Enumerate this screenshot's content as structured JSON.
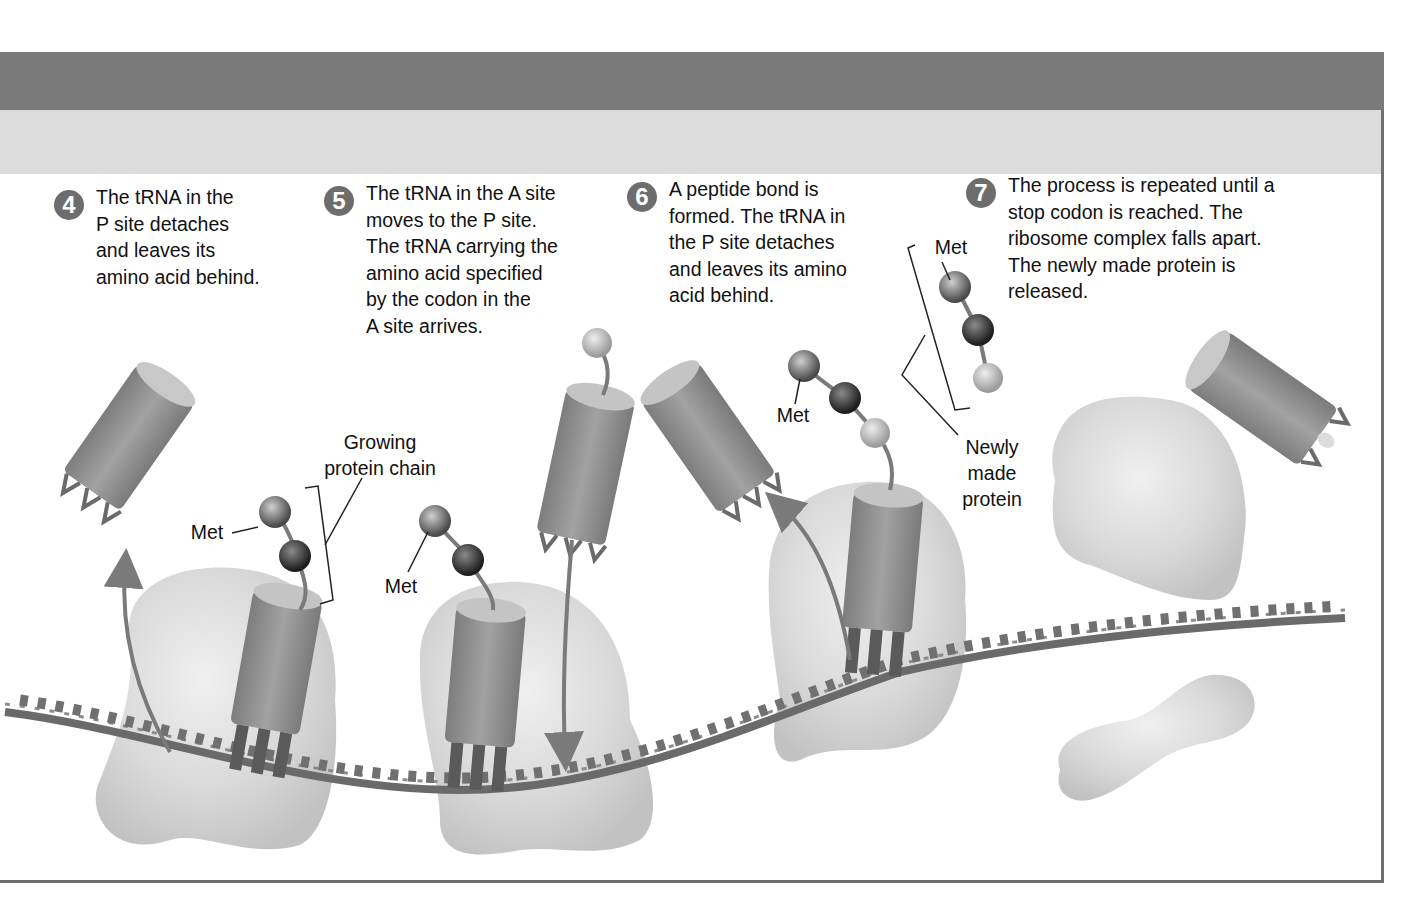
{
  "figure": {
    "colors": {
      "header_dark": "#7a7a7a",
      "header_light": "#dcdcdc",
      "frame": "#6e6e6e",
      "step_badge": "#6d6d6d",
      "ribosome": "#d6d6d6",
      "trna": "#8a8a8a",
      "mrna": "#6a6a6a"
    }
  },
  "steps": [
    {
      "number": "4",
      "text": "The tRNA in the\nP site detaches\nand leaves its\namino acid behind."
    },
    {
      "number": "5",
      "text": "The tRNA in the A site\nmoves to the P site.\nThe tRNA carrying the\namino acid specified\nby the codon in the\nA site arrives."
    },
    {
      "number": "6",
      "text": "A peptide bond is\nformed. The tRNA in\nthe P site detaches\nand leaves its amino\nacid behind."
    },
    {
      "number": "7",
      "text": "The process is repeated until a\nstop codon is reached. The\nribosome complex falls apart.\nThe newly made protein is\nreleased."
    }
  ],
  "labels": {
    "growing_chain": "Growing\nprotein chain",
    "met_step4": "Met",
    "met_step5": "Met",
    "met_step6": "Met",
    "met_step7": "Met",
    "newly_made": "Newly\nmade\nprotein"
  },
  "diagram_nodes": [
    {
      "id": "trna-released-4",
      "type": "tRNA",
      "state": "leaving"
    },
    {
      "id": "ribosome-4",
      "type": "ribosome",
      "chain": [
        "Met",
        "aa2"
      ]
    },
    {
      "id": "ribosome-5",
      "type": "ribosome",
      "chain": [
        "Met",
        "aa2"
      ],
      "incoming_trna": "aa3"
    },
    {
      "id": "ribosome-6",
      "type": "ribosome",
      "chain": [
        "Met",
        "aa2",
        "aa3"
      ]
    },
    {
      "id": "trna-released-6",
      "type": "tRNA",
      "state": "leaving"
    },
    {
      "id": "protein-7",
      "type": "protein",
      "chain": [
        "Met",
        "aa2",
        "aa3"
      ]
    },
    {
      "id": "ribosome-large-7",
      "type": "ribosome-subunit",
      "state": "dissociated"
    },
    {
      "id": "ribosome-small-7",
      "type": "ribosome-subunit",
      "state": "dissociated"
    },
    {
      "id": "trna-released-7",
      "type": "tRNA",
      "state": "released"
    }
  ]
}
